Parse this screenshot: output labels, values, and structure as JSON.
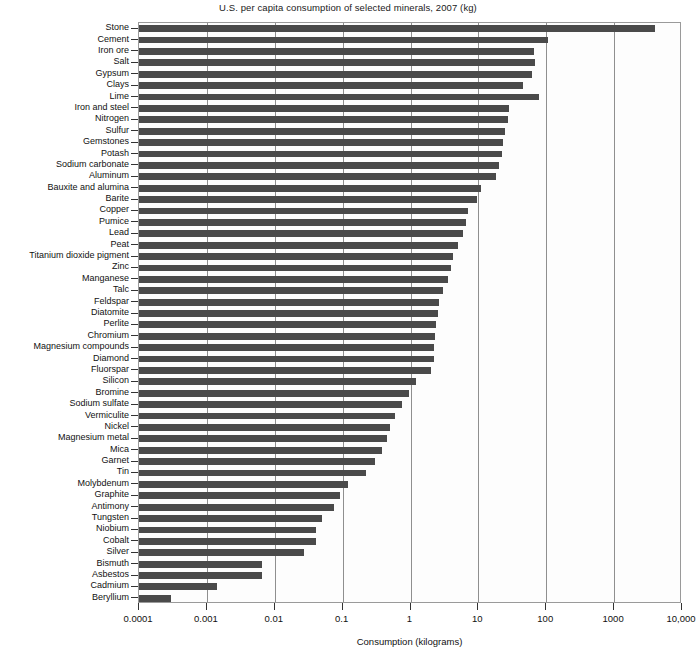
{
  "chart_data": {
    "type": "bar",
    "orientation": "horizontal",
    "title": "U.S. per capita consumption of selected minerals, 2007 (kg)",
    "xlabel": "Consumption (kilograms)",
    "ylabel": "",
    "xscale": "log",
    "xlim": [
      0.0001,
      10000
    ],
    "xticks": [
      0.0001,
      0.001,
      0.01,
      0.1,
      1,
      10,
      100,
      1000,
      10000
    ],
    "xtick_labels": [
      "0.0001",
      "0.001",
      "0.01",
      "0.1",
      "1",
      "10",
      "100",
      "1000",
      "10,000"
    ],
    "grid": true,
    "grid_axis": "x",
    "legend": false,
    "bar_color": "#4a4a4a",
    "categories": [
      "Stone",
      "Cement",
      "Iron ore",
      "Salt",
      "Gypsum",
      "Clays",
      "Lime",
      "Iron and steel",
      "Nitrogen",
      "Sulfur",
      "Gemstones",
      "Potash",
      "Sodium carbonate",
      "Aluminum",
      "Bauxite and alumina",
      "Barite",
      "Copper",
      "Pumice",
      "Lead",
      "Peat",
      "Titanium dioxide pigment",
      "Zinc",
      "Manganese",
      "Talc",
      "Feldspar",
      "Diatomite",
      "Perlite",
      "Chromium",
      "Magnesium compounds",
      "Diamond",
      "Fluorspar",
      "Silicon",
      "Bromine",
      "Sodium sulfate",
      "Vermiculite",
      "Nickel",
      "Magnesium metal",
      "Mica",
      "Garnet",
      "Tin",
      "Molybdenum",
      "Graphite",
      "Antimony",
      "Tungsten",
      "Niobium",
      "Cobalt",
      "Silver",
      "Bismuth",
      "Asbestos",
      "Cadmium",
      "Beryllium"
    ],
    "values": [
      4000,
      105,
      66,
      68,
      62,
      45,
      77,
      28,
      27,
      25,
      23,
      22,
      20,
      18,
      11,
      9.5,
      7.0,
      6.5,
      6.0,
      5.0,
      4.2,
      4.0,
      3.6,
      3.0,
      2.6,
      2.5,
      2.4,
      2.3,
      2.2,
      2.2,
      2.0,
      1.2,
      0.95,
      0.75,
      0.6,
      0.5,
      0.45,
      0.38,
      0.3,
      0.22,
      0.12,
      0.09,
      0.075,
      0.05,
      0.04,
      0.04,
      0.027,
      0.0065,
      0.0065,
      0.0014,
      0.0003
    ]
  }
}
